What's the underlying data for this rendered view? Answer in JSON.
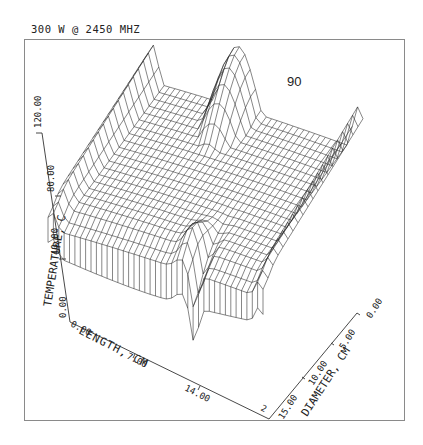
{
  "header": {
    "caption": "300 W @  2450 MHZ"
  },
  "chart_data": {
    "type": "surface3d",
    "title": "300 W @ 2450 MHZ",
    "annotation": "90",
    "xlabel": "LENGTH, CM",
    "ylabel": "DIAMETER, CM",
    "zlabel": "TEMPERATURE, C",
    "x_ticks": [
      "0.00",
      "7.00",
      "14.00"
    ],
    "x_end_partial_label": "2",
    "y_ticks": [
      "0.00",
      "5.00",
      "10.00",
      "15.00"
    ],
    "z_ticks": [
      "0.00",
      "40.00",
      "80.00",
      "120.00"
    ],
    "xlim": [
      0,
      21
    ],
    "ylim": [
      0,
      15
    ],
    "zlim": [
      0,
      120
    ],
    "grid": false,
    "style": "wireframe",
    "sample_points": [
      {
        "length": 0,
        "diameter": 0,
        "temp": 95
      },
      {
        "length": 7,
        "diameter": 0,
        "temp": 125
      },
      {
        "length": 14,
        "diameter": 0,
        "temp": 60
      },
      {
        "length": 21,
        "diameter": 0,
        "temp": 100
      },
      {
        "length": 0,
        "diameter": 15,
        "temp": 75
      },
      {
        "length": 10,
        "diameter": 15,
        "temp": 35
      },
      {
        "length": 14,
        "diameter": 15,
        "temp": 10
      },
      {
        "length": 21,
        "diameter": 15,
        "temp": 60
      },
      {
        "length": 10,
        "diameter": 7,
        "temp": 45
      }
    ]
  },
  "axes": {
    "z_title": "TEMPERATURE, C",
    "x_title": "LENGTH, CM",
    "y_title": "DIAMETER, CM",
    "z_ticks": [
      "0.00",
      "40.00",
      "80.00",
      "120.00"
    ],
    "x_ticks": [
      "0.00",
      "7.00",
      "14.00"
    ],
    "y_ticks": [
      "0.00",
      "5.00",
      "10.00",
      "15.00"
    ],
    "x_partial": "2"
  },
  "annotation": {
    "label": "90"
  },
  "colors": {
    "line": "#222222",
    "frame": "#888888",
    "background": "#ffffff"
  }
}
